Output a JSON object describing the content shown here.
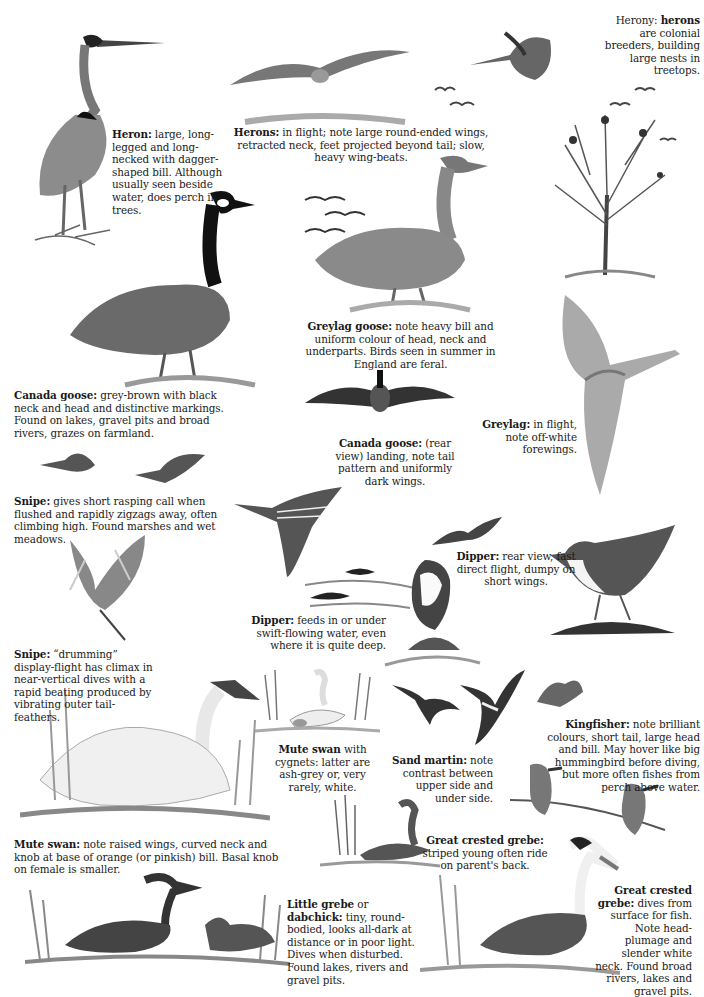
{
  "page": {
    "background": "#ffffff",
    "ink": "#1a1a1a"
  },
  "captions": {
    "herony": {
      "lead": "Herony: ",
      "bold": "herons",
      "text": " are colonial breeders, building large nests in treetops."
    },
    "heron": {
      "bold": "Heron:",
      "text": " large, long-legged and long-necked with dagger-shaped bill. Although usually seen beside water, does perch in trees."
    },
    "herons_flight": {
      "bold": "Herons:",
      "text": " in flight; note large round-ended wings, retracted neck, feet projected beyond tail; slow, heavy wing-beats."
    },
    "canada_goose": {
      "bold": "Canada goose:",
      "text": " grey-brown with black neck and head and distinctive markings. Found on lakes, gravel pits and broad rivers, grazes on farmland."
    },
    "greylag_goose": {
      "bold": "Greylag goose:",
      "text": " note heavy bill and uniform colour of head, neck and underparts. Birds seen in summer in England are feral."
    },
    "canada_goose_rear": {
      "bold": "Canada goose:",
      "text": " (rear view) landing, note tail pattern and uniformly dark wings."
    },
    "greylag_flight": {
      "bold": "Greylag:",
      "text": " in flight, note off-white forewings."
    },
    "snipe": {
      "bold": "Snipe:",
      "text": " gives short rasping call when flushed and rapidly zigzags away, often climbing high. Found marshes and wet meadows."
    },
    "dipper_flight": {
      "bold": "Dipper:",
      "text": " rear view, fast direct flight, dumpy on short wings."
    },
    "dipper": {
      "bold": "Dipper:",
      "text": " feeds in or under swift-flowing water, even where it is quite deep."
    },
    "snipe_drumming": {
      "bold": "Snipe:",
      "text": " “drumming” display-flight has climax in near-vertical dives with a rapid beating produced by vibrating outer tail-feathers."
    },
    "mute_swan_cygnets": {
      "bold": "Mute swan",
      "text": " with cygnets: latter are ash-grey or, very rarely, white."
    },
    "sand_martin": {
      "bold": "Sand martin:",
      "text": " note contrast between upper side and under side."
    },
    "kingfisher": {
      "bold": "Kingfisher:",
      "text": " note brilliant colours, short tail, large head and bill. May hover like big hummingbird before diving, but more often fishes from perch above water."
    },
    "mute_swan": {
      "bold": "Mute swan:",
      "text": " note raised wings, curved neck and knob at base of orange (or pinkish) bill. Basal knob on female is smaller."
    },
    "great_crested_grebe_young": {
      "bold": "Great crested grebe:",
      "text": " striped young often ride on parent's back."
    },
    "little_grebe": {
      "bold": "Little grebe",
      "mid": " or ",
      "bold2": "dabchick:",
      "text": " tiny, round-bodied, looks all-dark at distance or in poor light. Dives when disturbed. Found lakes, rivers and gravel pits."
    },
    "great_crested_grebe": {
      "bold": "Great crested grebe:",
      "text": " dives from surface for fish. Note head-plumage and slender white neck. Found broad rivers, lakes and gravel pits."
    }
  },
  "illustrations": [
    "heron-standing",
    "herons-in-flight",
    "heron-flying-right",
    "herony-tree",
    "canada-goose-standing",
    "greylag-goose-standing",
    "geese-flock-flight",
    "canada-goose-landing-rear",
    "greylag-in-flight",
    "snipe-flying",
    "snipe-in-flight-long-bill",
    "snipe-drumming",
    "dipper-flying",
    "dipper-perched",
    "dipper-in-water",
    "dipper-on-rock",
    "mute-swan-with-cygnets",
    "mute-swan-swimming",
    "sand-martins",
    "kingfisher-hovering",
    "kingfishers-on-branch",
    "great-crested-grebe-with-young",
    "little-grebes",
    "great-crested-grebe-with-fish"
  ]
}
